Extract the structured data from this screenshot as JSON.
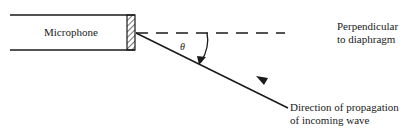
{
  "diagram": {
    "microphone_label": "Microphone",
    "angle_symbol": "θ",
    "perpendicular_label": [
      "Perpendicular",
      "to diaphragm"
    ],
    "propagation_label": [
      "Direction of propagation",
      "of incoming wave"
    ],
    "colors": {
      "stroke": "#1a1a1a",
      "background": "#ffffff"
    }
  }
}
